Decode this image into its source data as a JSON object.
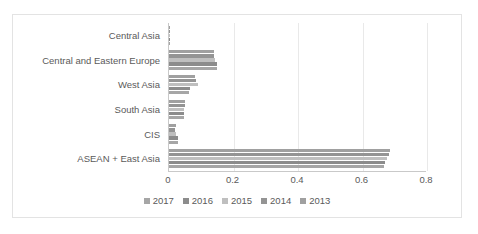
{
  "chart_data": {
    "type": "bar",
    "orientation": "horizontal",
    "title": "",
    "xlabel": "",
    "ylabel": "",
    "xlim": [
      0,
      0.8
    ],
    "xticks": [
      "0",
      "0.2",
      "0.4",
      "0.6",
      "0.8"
    ],
    "xtick_values": [
      0,
      0.2,
      0.4,
      0.6,
      0.8
    ],
    "grid": true,
    "grid_axis": "x",
    "legend_position": "bottom",
    "categories": [
      "Central Asia",
      "Central and Eastern Europe",
      "West Asia",
      "South Asia",
      "CIS",
      "ASEAN + East Asia"
    ],
    "series": [
      {
        "name": "2017",
        "color": "#a6a6a6",
        "values": [
          0.003,
          0.148,
          0.063,
          0.047,
          0.028,
          0.668
        ]
      },
      {
        "name": "2016",
        "color": "#8c8c8c",
        "values": [
          0.003,
          0.15,
          0.066,
          0.048,
          0.027,
          0.67
        ]
      },
      {
        "name": "2015",
        "color": "#bfbfbf",
        "values": [
          0.002,
          0.143,
          0.09,
          0.046,
          0.022,
          0.675
        ]
      },
      {
        "name": "2014",
        "color": "#949494",
        "values": [
          0.002,
          0.14,
          0.085,
          0.05,
          0.02,
          0.681
        ]
      },
      {
        "name": "2013",
        "color": "#a0a0a0",
        "values": [
          0.002,
          0.139,
          0.082,
          0.051,
          0.022,
          0.686
        ]
      }
    ]
  },
  "legend": {
    "items": [
      {
        "label": "2017",
        "color": "#a6a6a6"
      },
      {
        "label": "2016",
        "color": "#8c8c8c"
      },
      {
        "label": "2015",
        "color": "#bfbfbf"
      },
      {
        "label": "2014",
        "color": "#949494"
      },
      {
        "label": "2013",
        "color": "#a0a0a0"
      }
    ]
  },
  "colors": {
    "axis": "#c9c9c9",
    "grid": "#e9e9e9",
    "text": "#5a5a5a",
    "border": "#e3e3e3",
    "background": "#ffffff"
  }
}
